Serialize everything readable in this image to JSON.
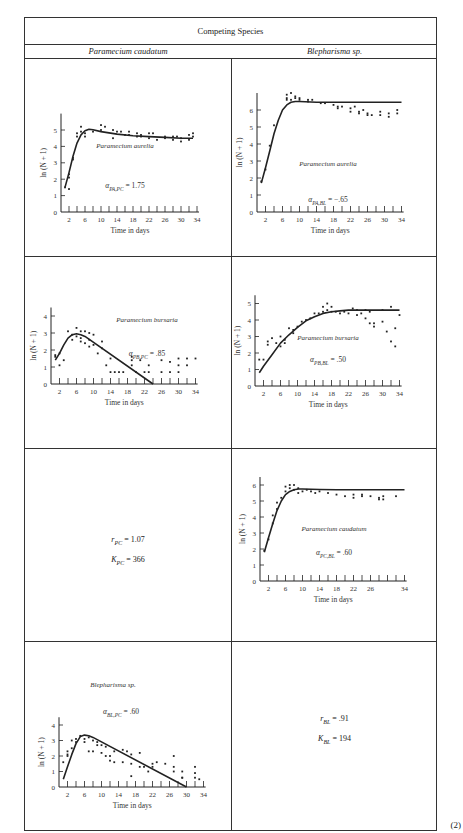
{
  "table": {
    "title": "Competing Species",
    "columns": [
      "Paramecium caudatum",
      "Blepharisma sp."
    ],
    "equation_number": "(2)"
  },
  "params": {
    "pc": {
      "r_label": "r",
      "r_sub": "PC",
      "r_value": "= 1.07",
      "k_label": "K",
      "k_sub": "PC",
      "k_value": "= 366"
    },
    "bl": {
      "r_label": "r",
      "r_sub": "BL",
      "r_value": "= .91",
      "k_label": "K",
      "k_sub": "BL",
      "k_value": "= 194"
    }
  },
  "colors": {
    "line": "#222222",
    "points": "#222222",
    "border": "#333333",
    "background": "#ffffff"
  },
  "chart_data": [
    {
      "id": "pa_pc",
      "type": "scatter+line",
      "title": "Paramecium aurelia",
      "annotation": "α_PA,PC = 1.75",
      "alpha_label": "α",
      "alpha_sub": "PA,PC",
      "alpha_value": "= 1.75",
      "xlabel": "Time in days",
      "ylabel": "ln (N + 1)",
      "xticks": [
        2,
        6,
        10,
        14,
        18,
        22,
        26,
        30,
        34
      ],
      "yticks": [
        0,
        1,
        2,
        3,
        4,
        5
      ],
      "xlim": [
        0,
        35
      ],
      "ylim": [
        0,
        6
      ],
      "curve": {
        "x": [
          1,
          2,
          3,
          4,
          5,
          6,
          7,
          8,
          10,
          14,
          18,
          22,
          26,
          30,
          33
        ],
        "y": [
          1.5,
          2.4,
          3.4,
          4.2,
          4.7,
          4.95,
          5.05,
          5.02,
          4.9,
          4.75,
          4.65,
          4.6,
          4.55,
          4.5,
          4.5
        ]
      },
      "points": {
        "x": [
          1,
          2,
          2,
          2,
          3,
          3,
          4,
          4,
          5,
          5,
          6,
          6,
          8,
          10,
          10,
          11,
          13,
          13,
          14,
          15,
          16,
          17,
          17,
          19,
          19,
          20,
          20,
          22,
          22,
          23,
          24,
          26,
          26,
          28,
          28,
          29,
          30,
          30,
          32,
          32,
          33,
          33
        ],
        "y": [
          1.5,
          2.3,
          2.1,
          1.4,
          3.3,
          3.2,
          4.8,
          4.6,
          5.2,
          4.9,
          4.8,
          4.6,
          4.9,
          5.3,
          5.0,
          5.2,
          5.0,
          4.5,
          4.9,
          4.9,
          4.7,
          4.9,
          4.7,
          4.8,
          4.6,
          4.7,
          4.6,
          4.8,
          4.5,
          4.8,
          4.4,
          4.6,
          4.5,
          4.6,
          4.4,
          4.6,
          4.5,
          4.3,
          4.7,
          4.4,
          4.8,
          4.6
        ]
      },
      "frame": {
        "x": 10,
        "y": 18,
        "w": 196,
        "h": 205,
        "ox": 36,
        "oy": 176,
        "xs": 4.0,
        "ys": 16.4,
        "title_x": 100,
        "title_y": 112,
        "ann_x": 100,
        "ann_y": 152
      }
    },
    {
      "id": "pa_bl",
      "type": "scatter+line",
      "title": "Paramecium aurelia",
      "annotation": "α_PA,BL = −.65",
      "alpha_label": "α",
      "alpha_sub": "PA,BL",
      "alpha_value": "= −.65",
      "xlabel": "Time in days",
      "ylabel": "ln (N + 1)",
      "xticks": [
        2,
        6,
        10,
        14,
        18,
        22,
        26,
        30,
        34
      ],
      "yticks": [
        0,
        1,
        2,
        3,
        4,
        5,
        6
      ],
      "xlim": [
        0,
        35
      ],
      "ylim": [
        0,
        7
      ],
      "curve": {
        "x": [
          1,
          2,
          3,
          4,
          5,
          6,
          7,
          8,
          9,
          10,
          14,
          18,
          22,
          26,
          30,
          34
        ],
        "y": [
          1.7,
          2.6,
          3.6,
          4.6,
          5.4,
          6.0,
          6.3,
          6.45,
          6.5,
          6.5,
          6.45,
          6.45,
          6.45,
          6.45,
          6.45,
          6.45
        ]
      },
      "points": {
        "x": [
          1,
          2,
          3,
          4,
          7,
          7,
          7,
          8,
          8,
          9,
          9,
          10,
          10,
          12,
          12,
          13,
          15,
          16,
          18,
          19,
          19,
          20,
          22,
          22,
          23,
          24,
          24,
          25,
          26,
          26,
          27,
          29,
          29,
          31,
          31,
          33,
          33
        ],
        "y": [
          1.8,
          2.5,
          3.9,
          5.1,
          6.6,
          6.9,
          6.7,
          7.0,
          6.6,
          6.8,
          6.7,
          6.7,
          6.6,
          6.6,
          6.5,
          6.6,
          6.4,
          6.4,
          6.3,
          6.2,
          6.1,
          6.2,
          6.1,
          5.9,
          6.2,
          5.9,
          5.8,
          6.0,
          5.8,
          5.7,
          5.7,
          5.9,
          5.7,
          5.8,
          5.6,
          6.0,
          5.8
        ]
      },
      "frame": {
        "x": 216,
        "y": 18,
        "w": 196,
        "h": 205,
        "ox": 29,
        "oy": 176,
        "xs": 4.25,
        "ys": 17.0,
        "title_x": 100,
        "title_y": 130,
        "ann_x": 100,
        "ann_y": 166
      }
    },
    {
      "id": "pb_pc",
      "type": "scatter+line",
      "title": "Paramecium bursaria",
      "annotation": "α_PB,PC = .85",
      "alpha_label": "α",
      "alpha_sub": "PB,PC",
      "alpha_value": "= .85",
      "xlabel": "Time in days",
      "ylabel": "ln (N + 1)",
      "xticks": [
        2,
        6,
        10,
        14,
        18,
        22,
        26,
        30,
        34
      ],
      "yticks": [
        0,
        1,
        2,
        3,
        4
      ],
      "xlim": [
        0,
        35
      ],
      "ylim": [
        0,
        4.5
      ],
      "curve": {
        "x": [
          1,
          2,
          3,
          4,
          5,
          6,
          7,
          8,
          24
        ],
        "y": [
          1.4,
          1.8,
          2.3,
          2.7,
          2.9,
          2.95,
          2.9,
          2.8,
          0
        ]
      },
      "points": {
        "x": [
          1,
          1,
          2,
          2,
          3,
          4,
          5,
          5,
          6,
          6,
          7,
          7,
          7,
          8,
          8,
          9,
          9,
          9,
          10,
          10,
          11,
          12,
          12,
          13,
          14,
          14,
          15,
          16,
          17,
          19,
          19,
          19,
          20,
          21,
          22,
          23,
          23,
          26,
          26,
          28,
          28,
          30,
          30,
          30,
          32,
          32,
          34
        ],
        "y": [
          1.6,
          1.7,
          1.1,
          1.8,
          1.4,
          3.1,
          2.9,
          2.6,
          3.3,
          2.8,
          3.1,
          2.7,
          2.5,
          3.1,
          2.4,
          3.0,
          2.6,
          2.2,
          2.9,
          2.3,
          1.8,
          2.5,
          2.1,
          1.1,
          1.5,
          0.7,
          0.7,
          0.7,
          0.7,
          1.6,
          1.4,
          1.1,
          0.7,
          1.4,
          0.7,
          1.1,
          0.7,
          1.4,
          0.7,
          1.3,
          0.7,
          1.5,
          1.1,
          0.7,
          1.5,
          1.1,
          1.5
        ]
      },
      "frame": {
        "x": 10,
        "y": 240,
        "w": 196,
        "h": 190,
        "ox": 26,
        "oy": 126,
        "xs": 4.25,
        "ys": 17.0,
        "title_x": 122,
        "title_y": 64,
        "ann_x": 122,
        "ann_y": 98
      }
    },
    {
      "id": "pb_bl",
      "type": "scatter+line",
      "title": "Paramecium bursaria",
      "annotation": "α_PB,BL = .50",
      "alpha_label": "α",
      "alpha_sub": "PB,BL",
      "alpha_value": "= .50",
      "xlabel": "Time in days",
      "ylabel": "ln (N + 1)",
      "xticks": [
        2,
        6,
        10,
        14,
        18,
        22,
        26,
        30,
        34
      ],
      "yticks": [
        0,
        1,
        2,
        3,
        4,
        5
      ],
      "xlim": [
        0,
        35
      ],
      "ylim": [
        0,
        5.5
      ],
      "curve": {
        "x": [
          1,
          2,
          4,
          6,
          8,
          10,
          12,
          14,
          16,
          18,
          20,
          22,
          26,
          30,
          34
        ],
        "y": [
          0.8,
          1.2,
          1.9,
          2.6,
          3.1,
          3.55,
          3.95,
          4.2,
          4.4,
          4.5,
          4.55,
          4.6,
          4.6,
          4.6,
          4.6
        ]
      },
      "points": {
        "x": [
          1,
          2,
          3,
          3,
          4,
          5,
          6,
          6,
          7,
          7,
          8,
          9,
          9,
          10,
          11,
          12,
          13,
          14,
          15,
          16,
          16,
          17,
          17,
          18,
          18,
          19,
          20,
          21,
          22,
          23,
          24,
          24,
          25,
          26,
          26,
          27,
          27,
          28,
          28,
          30,
          30,
          31,
          32,
          32,
          33,
          33,
          34
        ],
        "y": [
          1.6,
          1.6,
          2.7,
          2.5,
          2.9,
          2.6,
          2.4,
          3.0,
          2.8,
          2.6,
          3.5,
          3.4,
          3.2,
          3.6,
          3.9,
          4.0,
          4.1,
          4.4,
          4.4,
          4.8,
          4.5,
          5.0,
          4.6,
          4.8,
          4.5,
          4.5,
          4.4,
          4.5,
          4.4,
          4.7,
          4.6,
          4.3,
          4.4,
          4.6,
          4.1,
          3.8,
          4.5,
          3.6,
          3.8,
          4.6,
          3.9,
          3.3,
          2.7,
          4.8,
          3.5,
          2.4,
          4.3
        ]
      },
      "frame": {
        "x": 216,
        "y": 240,
        "w": 196,
        "h": 190,
        "ox": 27,
        "oy": 128,
        "xs": 4.25,
        "ys": 16.5,
        "title_x": 100,
        "title_y": 82,
        "ann_x": 100,
        "ann_y": 104
      }
    },
    {
      "id": "pc_bl",
      "type": "scatter+line",
      "title": "Paramecium caudatum",
      "annotation": "α_PC,BL = .60",
      "alpha_label": "α",
      "alpha_sub": "PC,BL",
      "alpha_value": "= .60",
      "xlabel": "Time in days",
      "ylabel": "ln (N + 1)",
      "xticks": [
        2,
        6,
        10,
        14,
        18,
        22,
        26,
        34
      ],
      "yticks": [
        0,
        1,
        2,
        3,
        4,
        5,
        6
      ],
      "xlim": [
        0,
        35
      ],
      "ylim": [
        0,
        6.5
      ],
      "curve": {
        "x": [
          1,
          2,
          3,
          4,
          5,
          6,
          7,
          8,
          9,
          10,
          14,
          18,
          22,
          26,
          30,
          34
        ],
        "y": [
          1.8,
          2.7,
          3.6,
          4.4,
          5.0,
          5.4,
          5.6,
          5.7,
          5.75,
          5.75,
          5.72,
          5.7,
          5.7,
          5.7,
          5.7,
          5.7
        ]
      },
      "points": {
        "x": [
          1,
          2,
          3,
          3,
          4,
          4,
          5,
          6,
          6,
          7,
          7,
          8,
          8,
          9,
          9,
          10,
          11,
          12,
          13,
          14,
          16,
          18,
          20,
          22,
          22,
          24,
          24,
          26,
          28,
          28,
          29,
          29,
          32
        ],
        "y": [
          1.9,
          2.6,
          4.1,
          3.6,
          4.5,
          4.9,
          5.2,
          5.9,
          5.6,
          6.0,
          5.8,
          6.0,
          5.7,
          5.8,
          5.5,
          5.6,
          5.7,
          5.6,
          5.5,
          5.6,
          5.5,
          5.4,
          5.3,
          5.4,
          5.2,
          5.4,
          5.3,
          5.3,
          5.2,
          5.1,
          5.3,
          5.1,
          5.3
        ]
      },
      "frame": {
        "x": 216,
        "y": 432,
        "w": 196,
        "h": 190,
        "ox": 32,
        "oy": 131,
        "xs": 4.25,
        "ys": 16.0,
        "title_x": 106,
        "title_y": 81,
        "ann_x": 106,
        "ann_y": 105
      }
    },
    {
      "id": "bl_pc",
      "type": "scatter+line",
      "title": "Blepharisma sp.",
      "annotation": "α_BL,PC = .60",
      "alpha_label": "α",
      "alpha_sub": "BL,PC",
      "alpha_value": "= .60",
      "xlabel": "Time in days",
      "ylabel": "ln (N + 1)",
      "xticks": [
        2,
        6,
        10,
        14,
        18,
        22,
        26,
        30,
        34
      ],
      "yticks": [
        0,
        1,
        2,
        3,
        4
      ],
      "xlim": [
        0,
        35
      ],
      "ylim": [
        0,
        4.5
      ],
      "curve": {
        "x": [
          1,
          2,
          3,
          4,
          5,
          6,
          7,
          8,
          30
        ],
        "y": [
          0.5,
          1.3,
          2.1,
          2.8,
          3.25,
          3.35,
          3.3,
          3.2,
          0
        ]
      },
      "points": {
        "x": [
          1,
          2,
          2,
          2,
          3,
          3,
          4,
          4,
          5,
          6,
          6,
          7,
          7,
          8,
          8,
          9,
          9,
          10,
          10,
          11,
          11,
          12,
          12,
          13,
          13,
          15,
          15,
          16,
          17,
          17,
          17,
          19,
          19,
          20,
          21,
          22,
          22,
          23,
          25,
          27,
          27,
          27,
          29,
          29,
          29,
          32,
          32,
          32,
          33
        ],
        "y": [
          1.6,
          2.1,
          2.0,
          2.3,
          3.0,
          2.5,
          3.1,
          2.9,
          3.3,
          3.1,
          2.9,
          2.3,
          3.2,
          3.0,
          2.3,
          2.9,
          2.7,
          2.2,
          2.7,
          2.0,
          2.6,
          2.0,
          1.7,
          2.3,
          1.6,
          2.4,
          1.6,
          2.3,
          2.1,
          1.5,
          0.7,
          2.2,
          1.3,
          1.3,
          1.0,
          1.5,
          1.3,
          1.6,
          1.5,
          2.0,
          1.3,
          1.0,
          1.0,
          0.6,
          0.6,
          1.3,
          0.9,
          0.6,
          0.5
        ]
      },
      "frame": {
        "x": 10,
        "y": 624,
        "w": 196,
        "h": 190,
        "ox": 34,
        "oy": 145,
        "xs": 4.25,
        "ys": 15.5,
        "title_x": 88,
        "title_y": 45,
        "ann_x": 96,
        "ann_y": 72
      }
    }
  ]
}
